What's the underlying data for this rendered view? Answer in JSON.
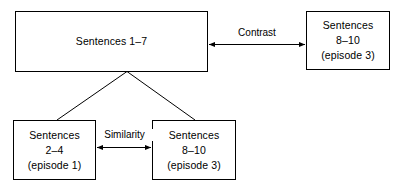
{
  "diagram": {
    "background_color": "#ffffff",
    "stroke_color": "#000000",
    "nodes": [
      {
        "id": "top-left",
        "lines": [
          "Sentences 1–7"
        ]
      },
      {
        "id": "top-right",
        "lines": [
          "Sentences",
          "8–10",
          "(episode 3)"
        ]
      },
      {
        "id": "bottom-left",
        "lines": [
          "Sentences",
          "2–4",
          "(episode 1)"
        ]
      },
      {
        "id": "bottom-mid",
        "lines": [
          "Sentences",
          "8–10",
          "(episode 3)"
        ]
      }
    ],
    "edges": [
      {
        "id": "contrast",
        "label": "Contrast",
        "from": "top-left",
        "to": "top-right",
        "style": "double-headed-arrow"
      },
      {
        "id": "similarity",
        "label": "Similarity",
        "from": "bottom-left",
        "to": "bottom-mid",
        "style": "double-headed-arrow"
      },
      {
        "id": "branch-left",
        "label": "",
        "from": "top-left",
        "to": "bottom-left",
        "style": "plain-line"
      },
      {
        "id": "branch-right",
        "label": "",
        "from": "top-left",
        "to": "bottom-mid",
        "style": "plain-line"
      }
    ]
  }
}
